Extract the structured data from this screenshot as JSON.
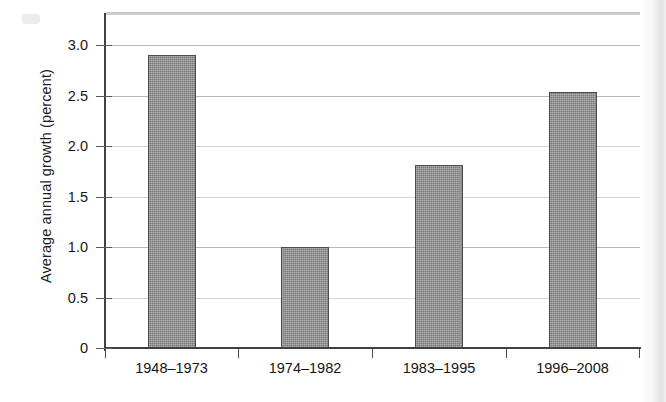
{
  "chart_data": {
    "type": "bar",
    "title": "",
    "xlabel": "",
    "ylabel": "Average annual growth (percent)",
    "categories": [
      "1948–1973",
      "1974–1982",
      "1983–1995",
      "1996–2008"
    ],
    "values": [
      2.9,
      1.0,
      1.81,
      2.53
    ],
    "ylim": [
      0,
      3.25
    ],
    "ytick_labels": [
      "0",
      "0.5",
      "1.0",
      "1.5",
      "2.0",
      "2.5",
      "3.0"
    ],
    "ytick_values": [
      0,
      0.5,
      1.0,
      1.5,
      2.0,
      2.5,
      3.0
    ],
    "grid": true,
    "legend": null,
    "series": [
      {
        "name": "Average annual growth",
        "values": [
          2.9,
          1.0,
          1.81,
          2.53
        ],
        "color": "#8c8c8c"
      }
    ]
  },
  "colors": {
    "bar_fill": "#8c8c8c",
    "bar_border": "#4d4d4d",
    "axis": "#414141",
    "gridline": "#b9b9b9",
    "text": "#161616",
    "background": "#ffffff"
  }
}
